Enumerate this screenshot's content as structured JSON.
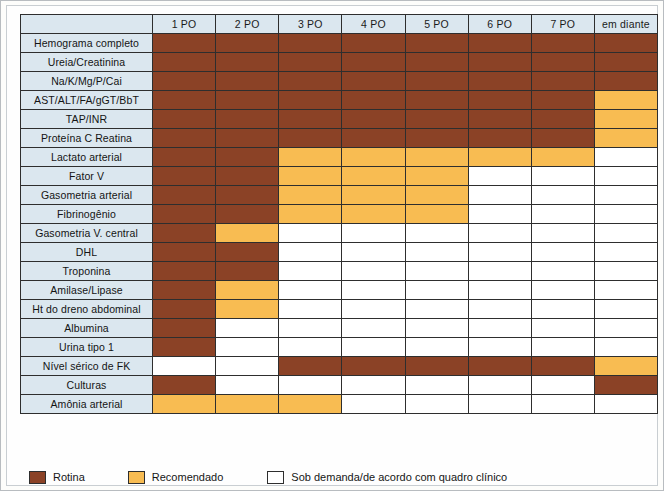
{
  "table": {
    "corner_label": "",
    "columns": [
      "1 PO",
      "2 PO",
      "3 PO",
      "4 PO",
      "5 PO",
      "6 PO",
      "7 PO",
      "em diante"
    ],
    "rows": [
      {
        "label": "Hemograma completo",
        "cells": [
          "routine",
          "routine",
          "routine",
          "routine",
          "routine",
          "routine",
          "routine",
          "routine"
        ]
      },
      {
        "label": "Ureia/Creatinina",
        "cells": [
          "routine",
          "routine",
          "routine",
          "routine",
          "routine",
          "routine",
          "routine",
          "routine"
        ]
      },
      {
        "label": "Na/K/Mg/P/Cai",
        "cells": [
          "routine",
          "routine",
          "routine",
          "routine",
          "routine",
          "routine",
          "routine",
          "routine"
        ]
      },
      {
        "label": "AST/ALT/FA/gGT/BbT",
        "cells": [
          "routine",
          "routine",
          "routine",
          "routine",
          "routine",
          "routine",
          "routine",
          "recommended"
        ]
      },
      {
        "label": "TAP/INR",
        "cells": [
          "routine",
          "routine",
          "routine",
          "routine",
          "routine",
          "routine",
          "routine",
          "recommended"
        ]
      },
      {
        "label": "Proteína C Reatina",
        "cells": [
          "routine",
          "routine",
          "routine",
          "routine",
          "routine",
          "routine",
          "routine",
          "recommended"
        ]
      },
      {
        "label": "Lactato arterial",
        "cells": [
          "routine",
          "routine",
          "recommended",
          "recommended",
          "recommended",
          "recommended",
          "recommended",
          "ondemand"
        ]
      },
      {
        "label": "Fator V",
        "cells": [
          "routine",
          "routine",
          "recommended",
          "recommended",
          "recommended",
          "ondemand",
          "ondemand",
          "ondemand"
        ]
      },
      {
        "label": "Gasometria arterial",
        "cells": [
          "routine",
          "routine",
          "recommended",
          "recommended",
          "recommended",
          "ondemand",
          "ondemand",
          "ondemand"
        ]
      },
      {
        "label": "Fibrinogênio",
        "cells": [
          "routine",
          "routine",
          "recommended",
          "recommended",
          "recommended",
          "ondemand",
          "ondemand",
          "ondemand"
        ]
      },
      {
        "label": "Gasometria V. central",
        "cells": [
          "routine",
          "recommended",
          "ondemand",
          "ondemand",
          "ondemand",
          "ondemand",
          "ondemand",
          "ondemand"
        ]
      },
      {
        "label": "DHL",
        "cells": [
          "routine",
          "routine",
          "ondemand",
          "ondemand",
          "ondemand",
          "ondemand",
          "ondemand",
          "ondemand"
        ]
      },
      {
        "label": "Troponina",
        "cells": [
          "routine",
          "routine",
          "ondemand",
          "ondemand",
          "ondemand",
          "ondemand",
          "ondemand",
          "ondemand"
        ]
      },
      {
        "label": "Amilase/Lipase",
        "cells": [
          "routine",
          "recommended",
          "ondemand",
          "ondemand",
          "ondemand",
          "ondemand",
          "ondemand",
          "ondemand"
        ]
      },
      {
        "label": "Ht do dreno abdominal",
        "cells": [
          "routine",
          "recommended",
          "ondemand",
          "ondemand",
          "ondemand",
          "ondemand",
          "ondemand",
          "ondemand"
        ]
      },
      {
        "label": "Albumina",
        "cells": [
          "routine",
          "ondemand",
          "ondemand",
          "ondemand",
          "ondemand",
          "ondemand",
          "ondemand",
          "ondemand"
        ]
      },
      {
        "label": "Urina tipo 1",
        "cells": [
          "routine",
          "ondemand",
          "ondemand",
          "ondemand",
          "ondemand",
          "ondemand",
          "ondemand",
          "ondemand"
        ]
      },
      {
        "label": "Nível sérico de FK",
        "cells": [
          "ondemand",
          "ondemand",
          "routine",
          "routine",
          "routine",
          "routine",
          "routine",
          "recommended"
        ]
      },
      {
        "label": "Culturas",
        "cells": [
          "routine",
          "ondemand",
          "ondemand",
          "ondemand",
          "ondemand",
          "ondemand",
          "ondemand",
          "routine"
        ]
      },
      {
        "label": "Amônia arterial",
        "cells": [
          "recommended",
          "recommended",
          "recommended",
          "ondemand",
          "ondemand",
          "ondemand",
          "ondemand",
          "ondemand"
        ]
      }
    ]
  },
  "legend": {
    "items": [
      {
        "key": "routine",
        "label": "Rotina"
      },
      {
        "key": "recommended",
        "label": "Recomendado"
      },
      {
        "key": "ondemand",
        "label": "Sob demanda/de acordo com quadro clínico"
      }
    ]
  },
  "colors": {
    "routine": "#8b4226",
    "recommended": "#f8bc52",
    "ondemand": "#ffffff",
    "header_bg": "#dbe7ef",
    "grid_line": "#2e2e2e"
  }
}
